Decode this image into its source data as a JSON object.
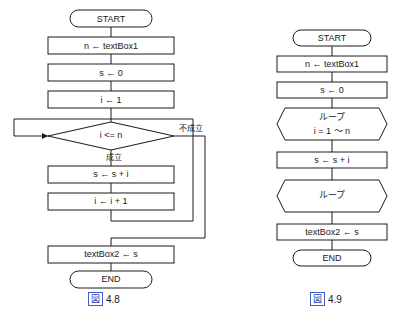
{
  "figures": [
    {
      "id": "fig-4-8",
      "caption_box": "図",
      "caption_number": "4.8",
      "nodes": {
        "start": "START",
        "input": "n ← textBox1",
        "init_s": "s ← 0",
        "init_i": "i ← 1",
        "condition": "i <= n",
        "cond_true": "成立",
        "cond_false": "不成立",
        "sum": "s ← s + i",
        "increment": "i ← i + 1",
        "output": "textBox2 ← s",
        "end": "END"
      }
    },
    {
      "id": "fig-4-9",
      "caption_box": "図",
      "caption_number": "4.9",
      "nodes": {
        "start": "START",
        "input": "n ← textBox1",
        "init_s": "s ← 0",
        "loop_start_line1": "ループ",
        "loop_start_line2": "i = 1 ～ n",
        "sum": "s ← s + i",
        "loop_end": "ループ",
        "output": "textBox2 ← s",
        "end": "END"
      }
    }
  ],
  "colors": {
    "stroke": "#1a1a1a",
    "caption_accent": "#2b45a8",
    "background": "#ffffff"
  }
}
